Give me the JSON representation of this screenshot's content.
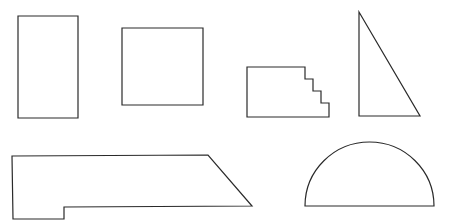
{
  "diagram": {
    "background": "#ffffff",
    "stroke_color": "#2a2a2a",
    "shapes": [
      {
        "name": "tall-rectangle",
        "type": "polygon",
        "points": "18,16 78,16 78,118 18,118"
      },
      {
        "name": "square",
        "type": "polygon",
        "points": "122,28 203,28 203,105 122,105"
      },
      {
        "name": "staircase-shape",
        "type": "polygon",
        "points": "247,67 305,67 305,79 313,79 313,91 321,91 321,103 329,103 329,117 247,117"
      },
      {
        "name": "right-triangle",
        "type": "polygon",
        "points": "359,12 420,116 359,116"
      },
      {
        "name": "notched-trapezoid",
        "type": "polygon",
        "points": "12,156 208,155 252,206 64,207 64,219 13,219"
      },
      {
        "name": "semicircle",
        "type": "path",
        "d": "M305,206 A64.5,64 0 0 1 434,206 Z"
      }
    ]
  }
}
